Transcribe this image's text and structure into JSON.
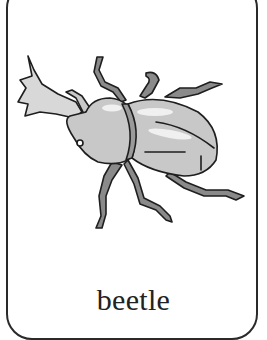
{
  "card": {
    "word": "beetle",
    "illustration": "rhinoceros-beetle",
    "colors": {
      "border": "#2a2a2a",
      "body_fill": "#c8c8c8",
      "leg_fill": "#8a8a8a",
      "outline": "#1e1e1e",
      "highlight": "#f0f0f0"
    }
  }
}
